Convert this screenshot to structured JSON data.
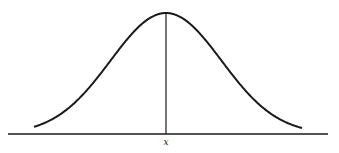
{
  "diagram": {
    "type": "normal-distribution-curve",
    "mean_label": "x",
    "colors": {
      "stroke": "#1a1a1a",
      "background": "#ffffff"
    },
    "geometry": {
      "baseline": {
        "x1": 8,
        "x2": 328,
        "y": 134
      },
      "peak": {
        "x": 166,
        "y": 13
      },
      "curve_start": {
        "x": 34,
        "y": 128
      },
      "curve_end": {
        "x": 302,
        "y": 128
      },
      "label_pos": {
        "x": 166,
        "y": 137
      }
    }
  }
}
